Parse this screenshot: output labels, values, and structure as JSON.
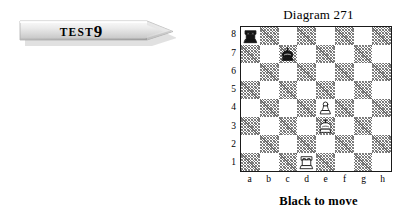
{
  "banner": {
    "name": "test-banner",
    "word": "TEST",
    "number": "9",
    "shape": "pennant-arrow",
    "fill_light": "#f2f2f2",
    "fill_mid": "#d8d8d8",
    "fill_dark": "#9a9a9a"
  },
  "diagram": {
    "title": "Diagram 271",
    "caption": "Black to move",
    "rank_labels": [
      "8",
      "7",
      "6",
      "5",
      "4",
      "3",
      "2",
      "1"
    ],
    "file_labels": [
      "a",
      "b",
      "c",
      "d",
      "e",
      "f",
      "g",
      "h"
    ],
    "colors": {
      "light_square": "#ffffff",
      "dark_square": "#808080",
      "border": "#1a1a1a",
      "text": "#000000"
    }
  },
  "chart_data": {
    "type": "table",
    "title": "Diagram 271",
    "subtitle": "Black to move",
    "xlabel": "file",
    "ylabel": "rank",
    "categories": [
      "a",
      "b",
      "c",
      "d",
      "e",
      "f",
      "g",
      "h"
    ],
    "ranks": [
      "8",
      "7",
      "6",
      "5",
      "4",
      "3",
      "2",
      "1"
    ],
    "orientation": "white-bottom",
    "side_to_move": "black",
    "pieces": [
      {
        "square": "a8",
        "file": "a",
        "rank": "8",
        "piece": "rook",
        "color": "black",
        "glyph": "♜"
      },
      {
        "square": "c7",
        "file": "c",
        "rank": "7",
        "piece": "king",
        "color": "black",
        "glyph": "♚"
      },
      {
        "square": "e4",
        "file": "e",
        "rank": "4",
        "piece": "pawn",
        "color": "white",
        "glyph": "♙"
      },
      {
        "square": "e3",
        "file": "e",
        "rank": "3",
        "piece": "king",
        "color": "white",
        "glyph": "♔"
      },
      {
        "square": "d1",
        "file": "d",
        "rank": "1",
        "piece": "rook",
        "color": "white",
        "glyph": "♖"
      }
    ],
    "fen": "r7/2k5/8/8/4P3/4K3/8/3R4 b - - 0 1",
    "dark_square_parity": "a8-light",
    "grid": true,
    "legend": "none"
  }
}
